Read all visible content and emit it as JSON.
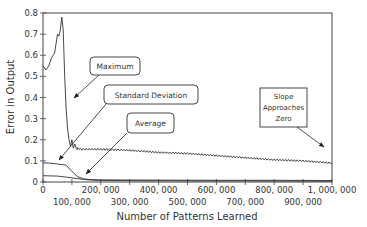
{
  "chart_data": {
    "type": "line",
    "title": "",
    "xlabel": "Number of Patterns Learned",
    "ylabel": "Error in Output",
    "xlim": [
      0,
      1000000
    ],
    "ylim": [
      0,
      0.8
    ],
    "grid": false,
    "legend": "none (callout annotations)",
    "yticks": [
      0,
      0.1,
      0.2,
      0.3,
      0.4,
      0.5,
      0.6,
      0.7,
      0.8
    ],
    "ytick_labels": [
      "0",
      "0.1",
      "0.2",
      "0.3",
      "0.4",
      "0.5",
      "0.6",
      "0.7",
      "0.8"
    ],
    "xticks": [
      0,
      100000,
      200000,
      300000,
      400000,
      500000,
      600000,
      700000,
      800000,
      900000,
      1000000
    ],
    "xtick_labels": [
      "0",
      "100, 000",
      "200, 000",
      "300, 000",
      "400, 000",
      "500, 000",
      "600, 000",
      "700, 000",
      "800, 000",
      "900, 000",
      "1, 000, 000"
    ],
    "series": [
      {
        "name": "Maximum",
        "x": [
          0,
          10000,
          20000,
          30000,
          40000,
          50000,
          55000,
          60000,
          65000,
          70000,
          75000,
          80000,
          85000,
          90000,
          95000,
          100000,
          105000,
          110000,
          115000,
          120000,
          130000,
          150000,
          200000,
          300000,
          400000,
          500000,
          600000,
          700000,
          800000,
          900000,
          1000000
        ],
        "values": [
          0.55,
          0.53,
          0.55,
          0.59,
          0.61,
          0.7,
          0.69,
          0.72,
          0.78,
          0.72,
          0.5,
          0.35,
          0.25,
          0.2,
          0.17,
          0.2,
          0.16,
          0.18,
          0.155,
          0.16,
          0.155,
          0.155,
          0.155,
          0.15,
          0.14,
          0.135,
          0.125,
          0.115,
          0.105,
          0.1,
          0.09
        ]
      },
      {
        "name": "Standard Deviation",
        "x": [
          0,
          20000,
          50000,
          80000,
          100000,
          120000,
          140000,
          160000,
          200000,
          400000,
          600000,
          800000,
          1000000
        ],
        "values": [
          0.09,
          0.09,
          0.085,
          0.08,
          0.05,
          0.025,
          0.015,
          0.012,
          0.01,
          0.009,
          0.008,
          0.008,
          0.007
        ]
      },
      {
        "name": "Average",
        "x": [
          0,
          50000,
          100000,
          140000,
          180000,
          300000,
          500000,
          700000,
          1000000
        ],
        "values": [
          0.03,
          0.028,
          0.02,
          0.012,
          0.008,
          0.006,
          0.005,
          0.005,
          0.004
        ]
      }
    ],
    "annotations": [
      {
        "text": "Maximum",
        "points_to": "Maximum curve at ~x=70,000, y~0.4"
      },
      {
        "text": "Standard Deviation",
        "points_to": "Standard Deviation curve at ~x=50,000, y~0.09"
      },
      {
        "text": "Average",
        "points_to": "Average curve at ~x=160,000, y~0.01"
      },
      {
        "text": "Slope Approaches Zero",
        "lines": [
          "Slope",
          "Approaches",
          "Zero"
        ],
        "points_to": "Maximum curve near x=1,000,000, y~0.1"
      }
    ]
  },
  "labels": {
    "ylabel": "Error in Output",
    "xlabel": "Number of Patterns Learned",
    "callout_maximum": "Maximum",
    "callout_stddev": "Standard Deviation",
    "callout_average": "Average",
    "callout_slope_1": "Slope",
    "callout_slope_2": "Approaches",
    "callout_slope_3": "Zero"
  },
  "colors": {
    "line": "#333333",
    "axis": "#444444",
    "background": "#ffffff"
  }
}
